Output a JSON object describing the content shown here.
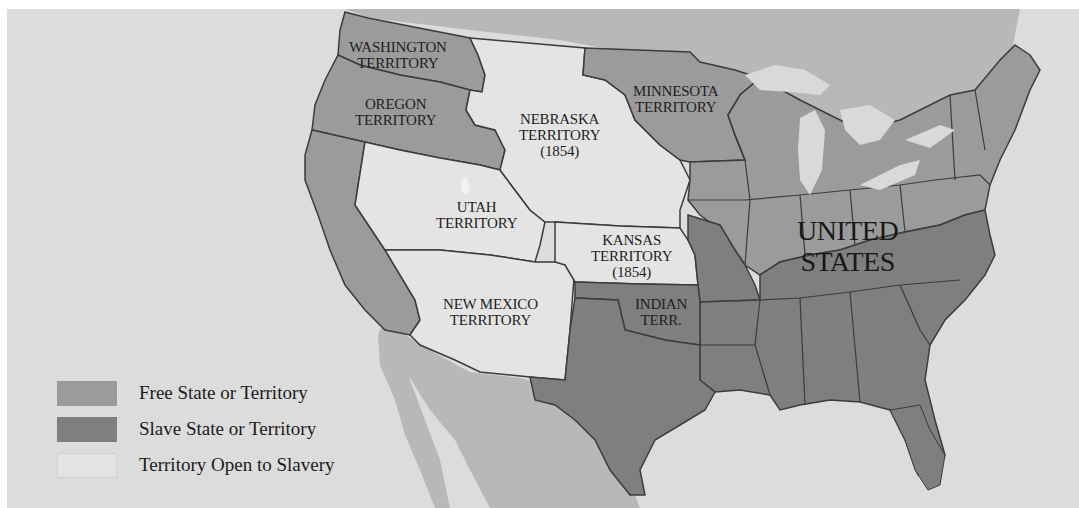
{
  "map": {
    "type": "historical-choropleth",
    "subject": "Kansas-Nebraska Act territories, 1854",
    "colors": {
      "ocean": "#dcdcdc",
      "foreign_land": "#b8b8b8",
      "free": "#9b9b9b",
      "slave": "#7f7f7f",
      "open": "#e4e4e4",
      "lakes": "#d9d9d9",
      "border": "#3c3c3c"
    },
    "labels": {
      "washington": "WASHINGTON\nTERRITORY",
      "oregon": "OREGON\nTERRITORY",
      "nebraska": "NEBRASKA\nTERRITORY\n(1854)",
      "minnesota": "MINNESOTA\nTERRITORY",
      "utah": "UTAH\nTERRITORY",
      "kansas": "KANSAS\nTERRITORY\n(1854)",
      "new_mexico": "NEW MEXICO\nTERRITORY",
      "indian": "INDIAN\nTERR.",
      "united_states": "UNITED\nSTATES"
    },
    "regions": [
      {
        "name": "Washington Territory",
        "status": "free"
      },
      {
        "name": "Oregon Territory",
        "status": "free"
      },
      {
        "name": "California",
        "status": "free"
      },
      {
        "name": "Minnesota Territory",
        "status": "free"
      },
      {
        "name": "Nebraska Territory (1854)",
        "status": "open"
      },
      {
        "name": "Kansas Territory (1854)",
        "status": "open"
      },
      {
        "name": "Utah Territory",
        "status": "open"
      },
      {
        "name": "New Mexico Territory",
        "status": "open"
      },
      {
        "name": "Indian Terr.",
        "status": "slave"
      },
      {
        "name": "Texas",
        "status": "slave"
      },
      {
        "name": "Missouri",
        "status": "slave"
      },
      {
        "name": "Southern States",
        "status": "slave"
      },
      {
        "name": "Northern States",
        "status": "free"
      }
    ]
  },
  "legend": {
    "items": [
      {
        "label": "Free State or Territory",
        "color": "#9b9b9b"
      },
      {
        "label": "Slave State or Territory",
        "color": "#7f7f7f"
      },
      {
        "label": "Territory Open to Slavery",
        "color": "#e4e4e4"
      }
    ]
  }
}
